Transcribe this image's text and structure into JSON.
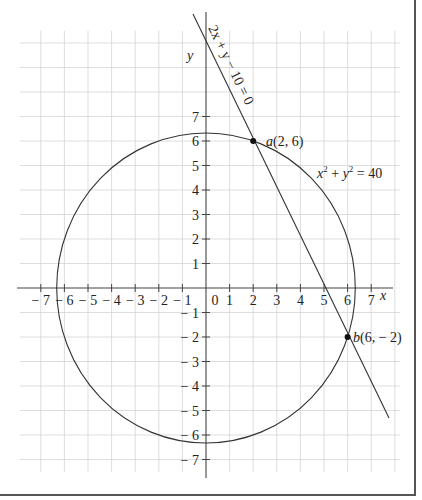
{
  "diagram": {
    "type": "coordinate-geometry",
    "axes": {
      "x_label": "x",
      "y_label": "y",
      "x_ticks": [
        "-7",
        "-6",
        "-5",
        "-4",
        "-3",
        "-2",
        "-1",
        "0",
        "1",
        "2",
        "3",
        "4",
        "5",
        "6",
        "7"
      ],
      "x_tick_labels": [
        "− 7",
        "− 6",
        "− 5",
        "− 4",
        "− 3",
        "− 2",
        "− 1",
        "0",
        "1",
        "2",
        "3",
        "4",
        "5",
        "6",
        "7"
      ],
      "y_tick_labels_pos": [
        "1",
        "2",
        "3",
        "4",
        "5",
        "6",
        "7"
      ],
      "y_tick_labels_neg": [
        "− 1",
        "− 2",
        "− 3",
        "− 4",
        "− 5",
        "− 6",
        "− 7"
      ],
      "x_range": [
        -8,
        8
      ],
      "y_range": [
        -8,
        11
      ],
      "grid": true
    },
    "curves": [
      {
        "name": "circle",
        "equation_label": "x² + y² = 40",
        "center": [
          0,
          0
        ],
        "radius_squared": 40
      },
      {
        "name": "line",
        "equation_label": "2x + y − 10 = 0"
      }
    ],
    "points": [
      {
        "name": "a",
        "coords": [
          2,
          6
        ],
        "label": "a(2, 6)"
      },
      {
        "name": "b",
        "coords": [
          6,
          -2
        ],
        "label": "b(6, − 2)"
      }
    ]
  },
  "labels": {
    "circle_eq_x": "x",
    "circle_eq_sup1": "2",
    "circle_eq_plus": " + ",
    "circle_eq_y": "y",
    "circle_eq_sup2": "2",
    "circle_eq_rhs": " = 40",
    "line_eq": "2x + y − 10 = 0",
    "point_a_name": "a",
    "point_a_coords": "(2, 6)",
    "point_b_name": "b",
    "point_b_coords": "(6, − 2)",
    "x_axis": "x",
    "y_axis": "y",
    "origin": "0"
  },
  "style": {
    "grid_color": "#d4d4d4",
    "axis_color": "#444444",
    "curve_color": "#333333",
    "border_color": "#555555"
  }
}
